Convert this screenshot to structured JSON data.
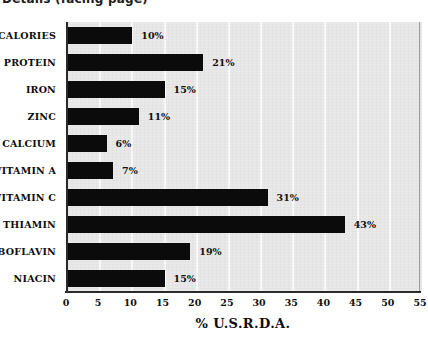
{
  "page": {
    "caption_cropped": "Details (facing page)"
  },
  "chart_data": {
    "type": "bar",
    "orientation": "horizontal",
    "title": "",
    "xlabel": "% U.S.R.D.A.",
    "ylabel": "",
    "xlim": [
      0,
      55
    ],
    "xticks": [
      0,
      5,
      10,
      15,
      20,
      25,
      30,
      35,
      40,
      45,
      50,
      55
    ],
    "grid": true,
    "grid_axis": "x",
    "legend": "none",
    "categories": [
      "CALORIES",
      "PROTEIN",
      "IRON",
      "ZINC",
      "CALCIUM",
      "VITAMIN A",
      "VITAMIN C",
      "THIAMIN",
      "RIBOFLAVIN",
      "NIACIN"
    ],
    "values": [
      10,
      21,
      15,
      11,
      6,
      7,
      31,
      43,
      19,
      15
    ],
    "value_labels": [
      "10%",
      "21%",
      "15%",
      "11%",
      "6%",
      "7%",
      "31%",
      "43%",
      "19%",
      "15%"
    ],
    "colors": {
      "bar": "#0b0b0b",
      "plot_background": "#e9e9e9",
      "gridline": "#fbfbfb",
      "axis": "#2a2a2a",
      "text": "#0d0d0d",
      "page_background": "#ffffff"
    }
  }
}
